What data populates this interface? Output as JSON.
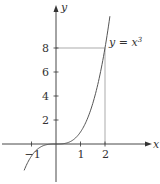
{
  "chart_data": {
    "type": "line",
    "title": "",
    "xlabel": "x",
    "ylabel": "y",
    "series": [
      {
        "name": "y = x^3",
        "function": "x^3",
        "x_range": [
          -1.3,
          2.2
        ]
      }
    ],
    "annotation": {
      "text_prefix": "y = x",
      "text_sup": "3",
      "guide_point": [
        2,
        8
      ]
    },
    "x_ticks": [
      -1,
      1,
      2
    ],
    "y_ticks": [
      2,
      4,
      6,
      8
    ],
    "x_tick_labels": [
      "−1",
      "1",
      "2"
    ],
    "y_tick_labels": [
      "2",
      "4",
      "6",
      "8"
    ],
    "xlim": [
      -1.8,
      2.6
    ],
    "ylim": [
      -2,
      12
    ],
    "grid": false,
    "legend": "none",
    "colors": {
      "curve": "#555555",
      "axis": "#333333",
      "guide": "#888888"
    }
  }
}
